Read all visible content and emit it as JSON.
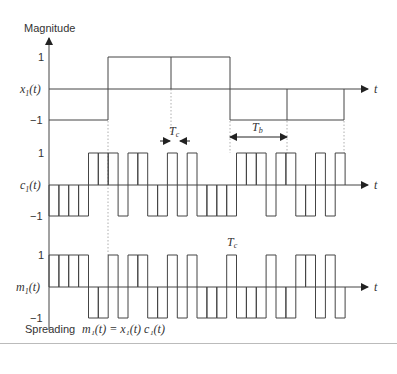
{
  "labels": {
    "y_axis_title": "Magnitude",
    "tick_pos": "1",
    "tick_neg": "−1",
    "t_axis": "t",
    "x1_name": "x",
    "x1_sub": "1",
    "x1_arg": "(t)",
    "c1_name": "c",
    "c1_sub": "1",
    "c1_arg": "(t)",
    "m1_name": "m",
    "m1_sub": "1",
    "m1_arg": "(t)",
    "tc_label": "T",
    "tc_sub": "c",
    "tb_label": "T",
    "tb_sub": "b",
    "caption_left": "Spreading",
    "formula": "m₁(t) = x₁(t) c₁(t)"
  },
  "colors": {
    "line": "#444444",
    "dotted": "#999999",
    "text": "#333333"
  },
  "chart_data": {
    "type": "line",
    "xlabel": "t",
    "ylabel": "Magnitude",
    "ylim": [
      -1,
      1
    ],
    "chips": 30,
    "chips_per_bit": 6,
    "series": [
      {
        "name": "x1(t)",
        "values": [
          -1,
          -1,
          -1,
          -1,
          -1,
          -1,
          1,
          1,
          1,
          1,
          1,
          1,
          1,
          1,
          1,
          1,
          1,
          1,
          -1,
          -1,
          -1,
          -1,
          -1,
          -1,
          -1,
          -1,
          -1,
          -1,
          -1,
          -1
        ]
      },
      {
        "name": "c1(t)",
        "values": [
          -1,
          -1,
          -1,
          -1,
          1,
          1,
          1,
          -1,
          1,
          1,
          -1,
          -1,
          1,
          -1,
          1,
          -1,
          -1,
          -1,
          -1,
          1,
          1,
          1,
          -1,
          1,
          1,
          -1,
          -1,
          1,
          -1,
          1
        ]
      },
      {
        "name": "m1(t)",
        "values": [
          1,
          1,
          1,
          1,
          -1,
          -1,
          1,
          -1,
          1,
          1,
          -1,
          -1,
          1,
          -1,
          1,
          -1,
          -1,
          -1,
          1,
          -1,
          -1,
          -1,
          1,
          -1,
          -1,
          1,
          1,
          -1,
          1,
          -1
        ]
      }
    ],
    "annotations": [
      "Tc (chip duration)",
      "Tb (bit duration)",
      "Spreading m1(t) = x1(t) c1(t)"
    ]
  }
}
